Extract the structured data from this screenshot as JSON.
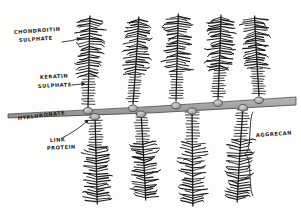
{
  "figure": {
    "style": "hand-drawn ink sketch",
    "background_color": "#fdfdfc",
    "ink_color": "#1c1c1c",
    "backbone_color": "#a0a0a0",
    "link_protein_color": "#b4b4b4"
  },
  "labels": {
    "chondroitin_sulphate": {
      "line1": "CHONDROITIN",
      "line2": "SULPHATE",
      "x": 14,
      "y": 34,
      "has_arrow": true
    },
    "keratan_sulphate": {
      "line1": "KERATIN",
      "line2": "SULPHATE",
      "x": 38,
      "y": 79,
      "has_arrow": true
    },
    "hyaluronate": {
      "line1": "HYALURONATE",
      "x": 18,
      "y": 116,
      "has_arrow": false
    },
    "link_protein": {
      "line1": "LINK",
      "line2": "PROTEIN",
      "x": 50,
      "y": 141,
      "has_arrow": true
    },
    "aggrecan": {
      "line1": "AGGRECAN",
      "x": 258,
      "y": 136,
      "has_brace": true
    }
  },
  "structure": {
    "backbone": {
      "name": "hyaluronate",
      "left_x": 8,
      "right_x": 296,
      "left_y": 114,
      "right_y": 97,
      "thickness_left": 4,
      "thickness_right": 8
    },
    "aggrecans_upper": {
      "count": 5,
      "stems_x": [
        88,
        133,
        176,
        218,
        259
      ],
      "base_y": [
        107,
        104,
        101,
        99,
        96
      ],
      "tip_y": [
        16,
        17,
        14,
        15,
        16
      ]
    },
    "aggrecans_lower": {
      "count": 4,
      "stems_x": [
        95,
        141,
        192,
        243
      ],
      "base_y": [
        115,
        112,
        109,
        107
      ],
      "tip_y": [
        204,
        200,
        206,
        202
      ]
    },
    "link_proteins_upper": {
      "count": 5,
      "positions_x": [
        88,
        133,
        176,
        218,
        259
      ]
    },
    "link_proteins_lower": {
      "count": 4,
      "positions_x": [
        95,
        141,
        192,
        243
      ]
    },
    "bristles": {
      "keratan_sulphate_region": "short straight bristles nearest the hyaluronate backbone",
      "chondroitin_sulphate_region": "long wavy feathery bristles at the distal end"
    }
  }
}
